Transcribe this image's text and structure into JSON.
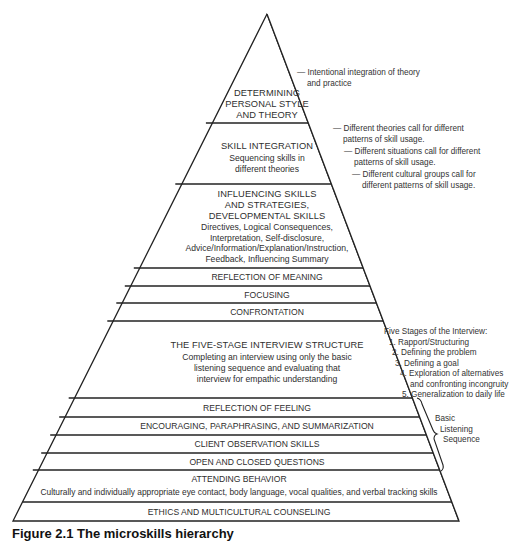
{
  "diagram": {
    "type": "pyramid",
    "title": "Microskills hierarchy",
    "tiers_top_to_bottom": [
      {
        "id": "personal-style",
        "heading": [
          "DETERMINING",
          "PERSONAL STYLE",
          "AND THEORY"
        ],
        "detail": []
      },
      {
        "id": "skill-integration",
        "heading": [
          "SKILL INTEGRATION"
        ],
        "detail": [
          "Sequencing skills in",
          "different theories"
        ]
      },
      {
        "id": "influencing",
        "heading": [
          "INFLUENCING SKILLS",
          "AND STRATEGIES,",
          "DEVELOPMENTAL SKILLS"
        ],
        "detail": [
          "Directives, Logical Consequences,",
          "Interpretation, Self-disclosure,",
          "Advice/Information/Explanation/Instruction,",
          "Feedback, Influencing Summary"
        ]
      },
      {
        "id": "reflection-meaning",
        "heading": [
          "REFLECTION OF MEANING"
        ],
        "detail": []
      },
      {
        "id": "focusing",
        "heading": [
          "FOCUSING"
        ],
        "detail": []
      },
      {
        "id": "confrontation",
        "heading": [
          "CONFRONTATION"
        ],
        "detail": []
      },
      {
        "id": "five-stage",
        "heading": [
          "THE FIVE-STAGE INTERVIEW STRUCTURE"
        ],
        "detail": [
          "Completing an interview using only the basic",
          "listening sequence and evaluating that",
          "interview for empathic understanding"
        ]
      },
      {
        "id": "reflection-feeling",
        "heading": [
          "REFLECTION OF FEELING"
        ],
        "detail": []
      },
      {
        "id": "encouraging",
        "heading": [
          "ENCOURAGING, PARAPHRASING, AND SUMMARIZATION"
        ],
        "detail": []
      },
      {
        "id": "client-observation",
        "heading": [
          "CLIENT OBSERVATION SKILLS"
        ],
        "detail": []
      },
      {
        "id": "questions",
        "heading": [
          "OPEN AND CLOSED QUESTIONS"
        ],
        "detail": []
      },
      {
        "id": "attending",
        "heading": [
          "ATTENDING BEHAVIOR"
        ],
        "detail": [
          "Culturally and individually appropriate eye contact, body language, vocal qualities, and verbal tracking skills"
        ]
      },
      {
        "id": "ethics",
        "heading": [
          "ETHICS AND MULTICULTURAL COUNSELING"
        ],
        "detail": []
      }
    ],
    "annotations": {
      "intentional": [
        "— Intentional integration of theory",
        "and practice"
      ],
      "theories": [
        "— Different theories call for different",
        "patterns of skill usage."
      ],
      "situations": [
        "— Different situations call for different",
        "patterns of skill usage."
      ],
      "cultural": [
        "— Different cultural groups call for",
        "different patterns of skill usage."
      ],
      "five_stages": {
        "title": "Five Stages of the Interview:",
        "items": [
          "1. Rapport/Structuring",
          "2. Defining the problem",
          "3. Defining a goal",
          "4. Exploration of alternatives",
          "and confronting incongruity",
          "5. Generalization to daily life"
        ]
      },
      "bls": [
        "Basic",
        "Listening",
        "Sequence"
      ]
    },
    "caption": "Figure 2.1  The microskills hierarchy"
  }
}
